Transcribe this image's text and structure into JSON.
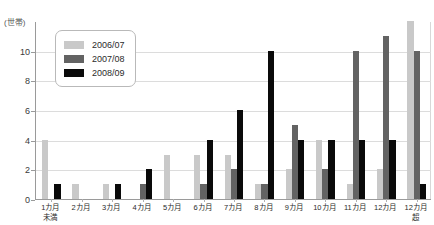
{
  "chart_data": {
    "type": "bar",
    "title": "",
    "subtitle": "",
    "xlabel": "",
    "ylabel": "(世帯)",
    "ylim": [
      0,
      12
    ],
    "yticks": [
      0,
      2,
      4,
      6,
      8,
      10
    ],
    "grid": true,
    "legend_position": "top-left",
    "categories": [
      "1カ月\n未満",
      "2カ月",
      "3カ月",
      "4カ月",
      "5カ月",
      "6カ月",
      "7カ月",
      "8カ月",
      "9カ月",
      "10カ月",
      "11カ月",
      "12カ月",
      "12カ月\n超"
    ],
    "series": [
      {
        "name": "2006/07",
        "color": "#c9c9c9",
        "values": [
          4,
          1,
          1,
          0,
          3,
          3,
          3,
          1,
          2,
          4,
          1,
          2,
          12
        ]
      },
      {
        "name": "2007/08",
        "color": "#636363",
        "values": [
          0,
          0,
          0,
          1,
          0,
          1,
          2,
          1,
          5,
          2,
          10,
          11,
          10
        ]
      },
      {
        "name": "2008/09",
        "color": "#0a0a0a",
        "values": [
          1,
          0,
          1,
          2,
          0,
          4,
          6,
          10,
          4,
          4,
          4,
          4,
          1
        ]
      }
    ]
  },
  "legend": {
    "items": [
      {
        "label": "2006/07"
      },
      {
        "label": "2007/08"
      },
      {
        "label": "2008/09"
      }
    ]
  },
  "axis": {
    "unit_label": "(世帯)"
  }
}
